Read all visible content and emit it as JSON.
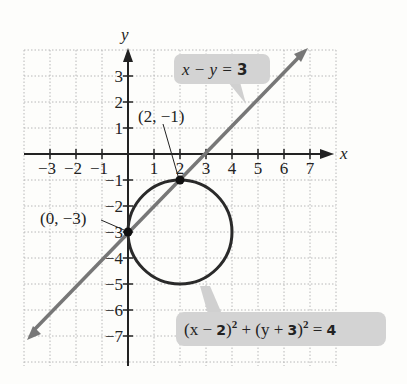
{
  "chart_data": {
    "type": "diagram",
    "title": "",
    "xlabel": "x",
    "ylabel": "y",
    "xlim": [
      -4,
      8
    ],
    "ylim": [
      -8,
      4
    ],
    "grid": true,
    "x_ticks": [
      "-3",
      "-2",
      "-1",
      "1",
      "2",
      "3",
      "4",
      "5",
      "6",
      "7"
    ],
    "y_ticks": [
      "3",
      "2",
      "1",
      "-1",
      "-2",
      "-3",
      "-4",
      "-5",
      "-6",
      "-7"
    ],
    "curves": [
      {
        "name": "line",
        "equation": "x − y = 3",
        "color": "#6e6e6e"
      },
      {
        "name": "circle",
        "equation": "(x − 2)² + (y + 3)² = 4",
        "center": [
          2,
          -3
        ],
        "radius": 2,
        "color": "#2a2a2a"
      }
    ],
    "points": [
      {
        "label": "(2, −1)",
        "x": 2,
        "y": -1
      },
      {
        "label": "(0, −3)",
        "x": 0,
        "y": -3
      }
    ]
  },
  "axes": {
    "x_label": "x",
    "y_label": "y"
  },
  "callouts": {
    "line": {
      "lhs": "x − y = ",
      "rhs": "3"
    },
    "circle": {
      "p1": "(x − ",
      "n1": "2",
      "p2": ")",
      "s1": "2",
      "p3": " + (y + ",
      "n2": "3",
      "p4": ")",
      "s2": "2",
      "p5": " = ",
      "n3": "4"
    }
  },
  "point_labels": {
    "p1": "(2, −1)",
    "p2": "(0, −3)"
  },
  "ticks": {
    "x": [
      {
        "v": -3,
        "t": "−3"
      },
      {
        "v": -2,
        "t": "−2"
      },
      {
        "v": -1,
        "t": "−1"
      },
      {
        "v": 1,
        "t": "1"
      },
      {
        "v": 2,
        "t": "2"
      },
      {
        "v": 3,
        "t": "3"
      },
      {
        "v": 4,
        "t": "4"
      },
      {
        "v": 5,
        "t": "5"
      },
      {
        "v": 6,
        "t": "6"
      },
      {
        "v": 7,
        "t": "7"
      }
    ],
    "y": [
      {
        "v": 3,
        "t": "3"
      },
      {
        "v": 2,
        "t": "2"
      },
      {
        "v": 1,
        "t": "1"
      },
      {
        "v": -1,
        "t": "−1"
      },
      {
        "v": -2,
        "t": "−2"
      },
      {
        "v": -3,
        "t": "−3"
      },
      {
        "v": -4,
        "t": "−4"
      },
      {
        "v": -5,
        "t": "−5"
      },
      {
        "v": -6,
        "t": "−6"
      },
      {
        "v": -7,
        "t": "−7"
      }
    ]
  }
}
